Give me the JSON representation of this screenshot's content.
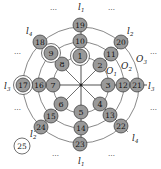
{
  "diagram": {
    "center": [
      81,
      85
    ],
    "ring_radii": [
      28,
      43,
      58
    ],
    "nodes": [
      {
        "id": "1",
        "x": 80,
        "y": 56,
        "double": true
      },
      {
        "id": "2",
        "x": 100,
        "y": 65
      },
      {
        "id": "3",
        "x": 108,
        "y": 85
      },
      {
        "id": "4",
        "x": 100,
        "y": 104
      },
      {
        "id": "5",
        "x": 81,
        "y": 112
      },
      {
        "id": "6",
        "x": 61,
        "y": 104
      },
      {
        "id": "7",
        "x": 53,
        "y": 85
      },
      {
        "id": "8",
        "x": 62,
        "y": 64
      },
      {
        "id": "9",
        "x": 51,
        "y": 53,
        "double": true
      },
      {
        "id": "10",
        "x": 80,
        "y": 41
      },
      {
        "id": "11",
        "x": 111,
        "y": 54
      },
      {
        "id": "12",
        "x": 123,
        "y": 85
      },
      {
        "id": "13",
        "x": 110,
        "y": 115
      },
      {
        "id": "14",
        "x": 81,
        "y": 128
      },
      {
        "id": "15",
        "x": 51,
        "y": 116
      },
      {
        "id": "16",
        "x": 39,
        "y": 85
      },
      {
        "id": "17",
        "x": 23,
        "y": 85,
        "double": true
      },
      {
        "id": "18",
        "x": 40,
        "y": 42
      },
      {
        "id": "19",
        "x": 80,
        "y": 25
      },
      {
        "id": "20",
        "x": 121,
        "y": 42
      },
      {
        "id": "21",
        "x": 137,
        "y": 85
      },
      {
        "id": "22",
        "x": 121,
        "y": 126
      },
      {
        "id": "23",
        "x": 80,
        "y": 144
      },
      {
        "id": "24",
        "x": 41,
        "y": 127
      },
      {
        "id": "25",
        "x": 22,
        "y": 146,
        "open": true
      }
    ],
    "line_labels": [
      {
        "text": "l",
        "sub": "1",
        "x": 78,
        "y": 10
      },
      {
        "text": "l",
        "sub": "1",
        "x": 78,
        "y": 164
      },
      {
        "text": "l",
        "sub": "2",
        "x": 127,
        "y": 34
      },
      {
        "text": "l",
        "sub": "2",
        "x": 30,
        "y": 137
      },
      {
        "text": "l",
        "sub": "3",
        "x": 4,
        "y": 89
      },
      {
        "text": "l",
        "sub": "3",
        "x": 148,
        "y": 89
      },
      {
        "text": "l",
        "sub": "4",
        "x": 26,
        "y": 34
      },
      {
        "text": "l",
        "sub": "4",
        "x": 132,
        "y": 141
      }
    ],
    "ring_labels": [
      {
        "text": "O",
        "sub": "1",
        "x": 106,
        "y": 74
      },
      {
        "text": "O",
        "sub": "2",
        "x": 121,
        "y": 69
      },
      {
        "text": "O",
        "sub": "3",
        "x": 136,
        "y": 62
      }
    ],
    "ellipsis": "⋯"
  }
}
